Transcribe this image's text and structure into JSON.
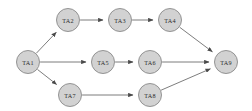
{
  "diagram": {
    "type": "directed-graph",
    "background_color": "#ffffff",
    "node_fill_color": "#d2d2d2",
    "node_stroke_color": "#8a8a8a",
    "edge_color": "#6e6e6e",
    "label_color": "#2b2b2b",
    "nodes": [
      {
        "id": "TA1",
        "label": "TA1",
        "x": 28,
        "y": 62,
        "r": 11.5
      },
      {
        "id": "TA2",
        "label": "TA2",
        "x": 68,
        "y": 20,
        "r": 11.5
      },
      {
        "id": "TA3",
        "label": "TA3",
        "x": 120,
        "y": 20,
        "r": 11.5
      },
      {
        "id": "TA4",
        "label": "TA4",
        "x": 170,
        "y": 20,
        "r": 11.5
      },
      {
        "id": "TA5",
        "label": "TA5",
        "x": 103,
        "y": 62,
        "r": 11.5
      },
      {
        "id": "TA6",
        "label": "TA6",
        "x": 150,
        "y": 62,
        "r": 11.5
      },
      {
        "id": "TA7",
        "label": "TA7",
        "x": 70,
        "y": 95,
        "r": 11.5
      },
      {
        "id": "TA8",
        "label": "TA8",
        "x": 150,
        "y": 95,
        "r": 11.5
      },
      {
        "id": "TA9",
        "label": "TA9",
        "x": 226,
        "y": 62,
        "r": 11.5
      }
    ],
    "edges": [
      {
        "from": "TA1",
        "to": "TA2"
      },
      {
        "from": "TA1",
        "to": "TA5"
      },
      {
        "from": "TA1",
        "to": "TA7"
      },
      {
        "from": "TA2",
        "to": "TA3"
      },
      {
        "from": "TA3",
        "to": "TA4"
      },
      {
        "from": "TA4",
        "to": "TA9"
      },
      {
        "from": "TA5",
        "to": "TA6"
      },
      {
        "from": "TA6",
        "to": "TA9"
      },
      {
        "from": "TA7",
        "to": "TA8"
      },
      {
        "from": "TA8",
        "to": "TA9"
      }
    ]
  }
}
